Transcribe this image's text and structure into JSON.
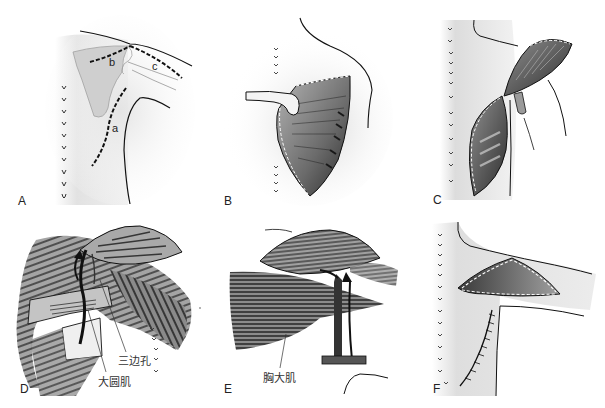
{
  "figure": {
    "panels": [
      {
        "id": "A",
        "label": "A",
        "sub_labels": [
          "a",
          "b",
          "c"
        ],
        "content": "Back and shoulder outline with dashed incision lines a, b, c over the scapula; row of spinous process marks"
      },
      {
        "id": "B",
        "label": "B",
        "content": "Open incision with retractor exposing muscle layers"
      },
      {
        "id": "C",
        "label": "C",
        "content": "Muscle flap elevated and rotated toward the shoulder on its pedicle"
      },
      {
        "id": "D",
        "label": "D",
        "annotations": [
          {
            "id": "triangular-space",
            "text": "三边孔"
          },
          {
            "id": "teres-major",
            "text": "大圆肌"
          }
        ],
        "content": "Flap passed through the triangular space with arrow showing transfer route"
      },
      {
        "id": "E",
        "label": "E",
        "annotations": [
          {
            "id": "pectoralis-major",
            "text": "胸大肌"
          }
        ],
        "content": "Flap passed beneath pectoralis major with vascular pedicle"
      },
      {
        "id": "F",
        "label": "F",
        "content": "Flap inset over the shoulder with sutured donor-site closure"
      }
    ]
  },
  "colors": {
    "ink": "#1a1a1a",
    "skin_shade": "#d9d9d9",
    "muscle_dark": "#3a3a3a",
    "muscle_mid": "#7a7a7a",
    "background": "#ffffff"
  }
}
